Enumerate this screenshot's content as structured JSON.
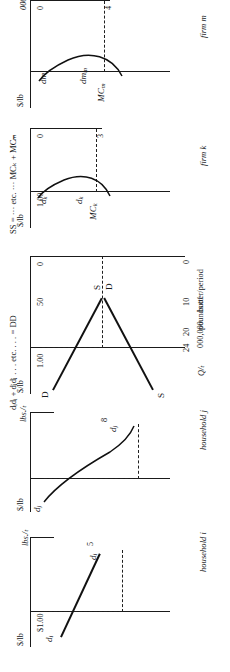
{
  "figure": {
    "type": "economics-supply-demand-derivation",
    "orientation": "rotated-90-ccw",
    "notes": {
      "demand_sum": "dᵢdᵢ + dⱼdⱼ . . . etc. . . . = DD",
      "supply_sum": "SS = ··· etc. ··· MCₖ + MCₘ"
    },
    "panels": [
      {
        "id": "household-i",
        "caption": "household i",
        "y_axis_label": "$/lb",
        "x_axis_label": "lbs./ₜ",
        "y_tick": "$1.00",
        "x_tick": "5",
        "curve_label_left": "d",
        "curve_label_left_sub": "i",
        "curve_label_right": "d",
        "curve_label_right_sub": "i"
      },
      {
        "id": "household-j",
        "caption": "household j",
        "y_axis_label": "$/lb",
        "x_axis_label": "lbs./ₜ",
        "y_tick": "",
        "x_tick": "8",
        "curve_label_left": "d",
        "curve_label_left_sub": "j",
        "curve_label_right": "d",
        "curve_label_right_sub": "j"
      },
      {
        "id": "market",
        "caption": "",
        "y_axis_label": "$/lb",
        "x_axis_label": "Q/ₜ",
        "x_axis_sublabel_1": "000,000",
        "x_axis_sublabel_2": "pounds of",
        "x_axis_sublabel_3": "butter/period",
        "y_ticks": [
          "1.00",
          "50",
          "0"
        ],
        "x_ticks": [
          "0",
          "10",
          "20",
          "24"
        ],
        "demand_label_top": "D",
        "demand_label_bottom": "D",
        "supply_label_top": "S",
        "supply_label_bottom": "S"
      },
      {
        "id": "firm-k",
        "caption": "firm k",
        "y_axis_label": "$/lb",
        "y_tick": "1.00",
        "x_ticks": [
          "0",
          "3"
        ],
        "mc_label": "MC",
        "mc_label_sub": "k",
        "d_label_upper": "d",
        "d_label_upper_sub": "k",
        "d_label_lower": "d",
        "d_label_lower_sub": "k"
      },
      {
        "id": "firm-m",
        "caption": "firm m",
        "y_axis_label": "$/lb",
        "x_axis_label": "000 lbs./ₜ",
        "x_ticks": [
          "0",
          "4"
        ],
        "mc_label": "MC",
        "mc_label_sub": "m",
        "d_label_upper": "dm",
        "d_label_upper_sub": "m",
        "d_label_lower": "dm"
      }
    ]
  }
}
